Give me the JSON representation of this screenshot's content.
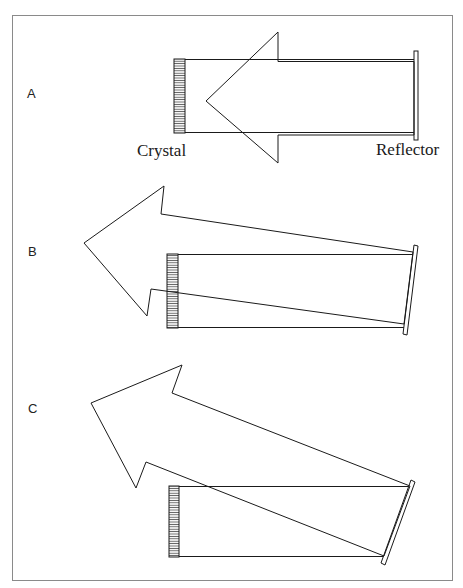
{
  "diagram": {
    "colors": {
      "stroke": "#1a1a1a",
      "frame": "#8a8a8a",
      "background": "#ffffff"
    },
    "panels": [
      {
        "id": "A",
        "label": "A",
        "crystal_label": "Crystal",
        "reflector_label": "Reflector",
        "description": "Reflector parallel to crystal; output beam returns straight back"
      },
      {
        "id": "B",
        "label": "B",
        "description": "Reflector slightly tilted; output beam deflected upward-left"
      },
      {
        "id": "C",
        "label": "C",
        "description": "Reflector strongly tilted; output beam deflected at larger angle"
      }
    ]
  }
}
